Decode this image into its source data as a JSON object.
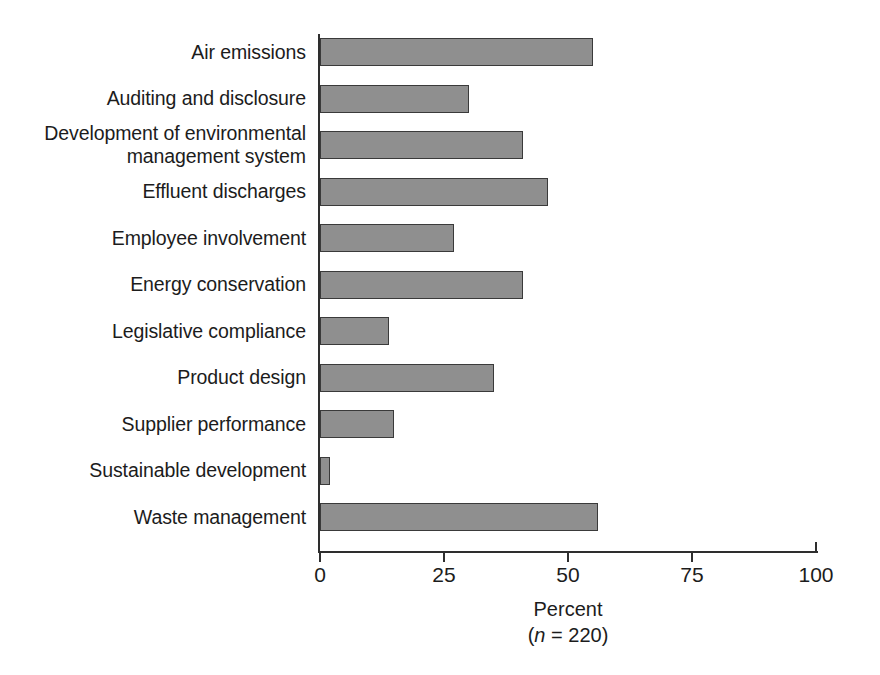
{
  "chart_data": {
    "type": "bar",
    "orientation": "horizontal",
    "title": "",
    "xlabel": "Percent",
    "xsublabel_prefix": "(",
    "xsublabel_italic": "n",
    "xsublabel_suffix": " = 220)",
    "ylabel": "",
    "xlim": [
      0,
      100
    ],
    "xticks": [
      0,
      25,
      50,
      75,
      100
    ],
    "xtick_labels": [
      "0",
      "25",
      "50",
      "75",
      "100"
    ],
    "grid": false,
    "legend": false,
    "sample_size": 220,
    "bar_fill_color": "#8f8f8f",
    "bar_edge_color": "#3a3a3a",
    "axis_color": "#2e2e2e",
    "background_color": "#ffffff",
    "categories": [
      "Air emissions",
      "Auditing and disclosure",
      "Development of environmental\nmanagement system",
      "Effluent discharges",
      "Employee involvement",
      "Energy conservation",
      "Legislative compliance",
      "Product design",
      "Supplier performance",
      "Sustainable development",
      "Waste management"
    ],
    "values": [
      55,
      30,
      41,
      46,
      27,
      41,
      14,
      35,
      15,
      2,
      56
    ],
    "points": [
      {
        "category": "Air emissions",
        "value": 55
      },
      {
        "category": "Auditing and disclosure",
        "value": 30
      },
      {
        "category": "Development of environmental management system",
        "value": 41
      },
      {
        "category": "Effluent discharges",
        "value": 46
      },
      {
        "category": "Employee involvement",
        "value": 27
      },
      {
        "category": "Energy conservation",
        "value": 41
      },
      {
        "category": "Legislative compliance",
        "value": 14
      },
      {
        "category": "Product design",
        "value": 35
      },
      {
        "category": "Supplier performance",
        "value": 15
      },
      {
        "category": "Sustainable development",
        "value": 2
      },
      {
        "category": "Waste management",
        "value": 56
      }
    ]
  }
}
